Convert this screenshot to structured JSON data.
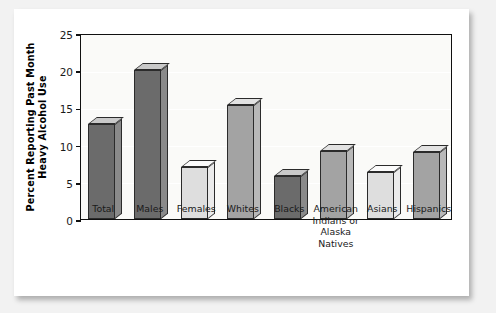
{
  "chart_data": {
    "type": "bar",
    "title": "",
    "xlabel": "",
    "ylabel_line1": "Percent Reporting Past Month",
    "ylabel_line2": "Heavy Alcohol Use",
    "categories": [
      "Total",
      "Males",
      "Females",
      "Whites",
      "Blacks",
      "American\nIndians or\nAlaska\nNatives",
      "Asians",
      "Hispanics"
    ],
    "values": [
      12.8,
      20.0,
      7.0,
      15.3,
      5.8,
      9.1,
      6.3,
      9.0
    ],
    "ylim": [
      0,
      25
    ],
    "yticks": [
      0,
      5,
      10,
      15,
      20,
      25
    ],
    "ytick_labels": [
      "0",
      "5",
      "10",
      "15",
      "20",
      "25"
    ],
    "grid": true,
    "legend": "none",
    "bar_shades": [
      "dark",
      "dark",
      "light",
      "medium",
      "dark",
      "medium",
      "light",
      "medium"
    ]
  },
  "colors": {
    "bar_dark_face": "#6b6b6b",
    "bar_dark_side": "#8a8a8a",
    "bar_dark_top": "#c9c9c9",
    "bar_medium_face": "#a3a3a3",
    "bar_medium_side": "#b8b8b8",
    "bar_medium_top": "#e2e2e2",
    "bar_light_face": "#dedede",
    "bar_light_side": "#ebebeb",
    "bar_light_top": "#fbfbfb",
    "plot_background": "#fafaf8",
    "axis": "#101010",
    "card": "#ffffff",
    "page_background": "#f2f2f2"
  }
}
